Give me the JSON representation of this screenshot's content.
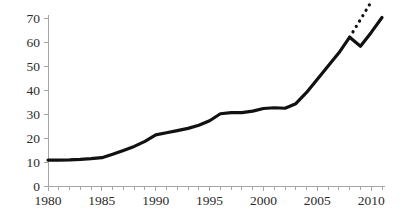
{
  "chart_data": {
    "type": "line",
    "title": "",
    "subtitle": "",
    "xlabel": "",
    "ylabel": "",
    "xlim": [
      1980,
      2011
    ],
    "ylim": [
      0,
      70
    ],
    "grid": false,
    "legend": null,
    "x_ticks_major": [
      1980,
      1985,
      1990,
      1995,
      2000,
      2005,
      2010
    ],
    "x_ticks_minor_step": 1,
    "y_ticks": [
      0,
      10,
      20,
      30,
      40,
      50,
      60,
      70
    ],
    "series": [
      {
        "name": "main",
        "style": "solid",
        "x": [
          1980,
          1981,
          1982,
          1983,
          1984,
          1985,
          1986,
          1987,
          1988,
          1989,
          1990,
          1991,
          1992,
          1993,
          1994,
          1995,
          1996,
          1997,
          1998,
          1999,
          2000,
          2001,
          2002,
          2003,
          2004,
          2005,
          2006,
          2007,
          2008,
          2009,
          2010,
          2011
        ],
        "values": [
          10.8,
          10.8,
          10.9,
          11.1,
          11.4,
          11.8,
          13.2,
          14.8,
          16.5,
          18.6,
          21.3,
          22.2,
          23.1,
          24.0,
          25.3,
          27.2,
          30.1,
          30.6,
          30.6,
          31.2,
          32.3,
          32.6,
          32.4,
          34.3,
          39.0,
          44.5,
          50.0,
          55.5,
          62.0,
          58.2,
          64.0,
          70.2
        ]
      },
      {
        "name": "trend",
        "style": "dotted",
        "x": [
          2008,
          2010.1
        ],
        "values": [
          62.0,
          77.5
        ]
      }
    ]
  },
  "axis": {
    "y_tick_labels": [
      "70",
      "60",
      "50",
      "40",
      "30",
      "20",
      "10",
      "0"
    ],
    "x_tick_labels": [
      "1980",
      "1985",
      "1990",
      "1995",
      "2000",
      "2005",
      "2010"
    ]
  },
  "colors": {
    "line": "#111111",
    "axis": "#a6a6a6",
    "text": "#2b2b2b",
    "background": "#ffffff"
  }
}
